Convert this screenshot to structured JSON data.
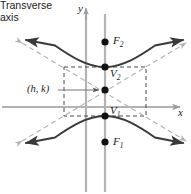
{
  "figure": {
    "labels": {
      "y_axis": "y",
      "x_axis": "x",
      "transverse_axis_line1": "Transverse",
      "transverse_axis_line2": "axis",
      "focus_upper": "F",
      "focus_upper_sub": "2",
      "focus_lower": "F",
      "focus_lower_sub": "1",
      "vertex_upper": "V",
      "vertex_upper_sub": "2",
      "vertex_lower": "V",
      "vertex_lower_sub": "1",
      "center": "(h, k)"
    },
    "colors": {
      "axis": "#9a9a9a",
      "curve": "#3a3a3a",
      "asymptote": "#b0b0b0",
      "box": "#4a4a4a",
      "point": "#111111",
      "leader": "#8a8a8a",
      "text": "#1a1a1a",
      "background": "#ffffff"
    },
    "geometry": {
      "y_axis_x": 86,
      "transverse_axis_x": 105,
      "x_axis_y": 107,
      "center_point": [
        105,
        91
      ],
      "vertex_upper_point": [
        105,
        67
      ],
      "vertex_lower_point": [
        105,
        116
      ],
      "focus_upper_point": [
        105,
        42
      ],
      "focus_lower_point": [
        105,
        142
      ],
      "box_left": 64,
      "box_right": 146,
      "box_top": 67,
      "box_bottom": 116
    }
  }
}
